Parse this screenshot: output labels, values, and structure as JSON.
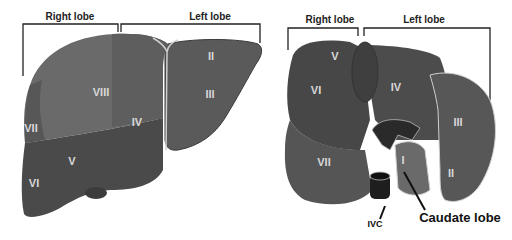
{
  "diagram": {
    "anterior_view": {
      "brackets": {
        "right": "Right lobe",
        "left": "Left lobe"
      },
      "segments": [
        "II",
        "III",
        "IV",
        "V",
        "VI",
        "VII",
        "VIII"
      ]
    },
    "posterior_view": {
      "brackets": {
        "right": "Right lobe",
        "left": "Left lobe"
      },
      "segments": [
        "I",
        "II",
        "III",
        "IV",
        "V",
        "VI",
        "VII"
      ],
      "annotations": {
        "ivc": "IVC",
        "caudate": "Caudate lobe"
      }
    },
    "colors": {
      "segment_light": "#6a6a6a",
      "segment_mid": "#555555",
      "segment_dark": "#454545",
      "ligament": "#cfcfcf",
      "background": "#ffffff"
    }
  }
}
